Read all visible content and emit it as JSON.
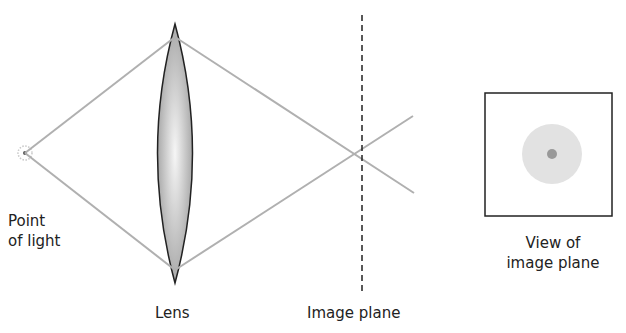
{
  "diagram": {
    "labels": {
      "point_of_light": [
        "Point",
        "of light"
      ],
      "lens": "Lens",
      "image_plane": "Image plane",
      "view_of_image_plane": [
        "View of",
        "image plane"
      ]
    },
    "colors": {
      "ray": "#b0b0b0",
      "lens_edge": "#222222",
      "lens_fill_center": "#f4f4f4",
      "lens_fill_edge": "#9a9a9a",
      "image_plane_line": "#222222",
      "blur_circle": "#e2e2e2",
      "focus_dot": "#999999",
      "box_border": "#222222"
    }
  }
}
